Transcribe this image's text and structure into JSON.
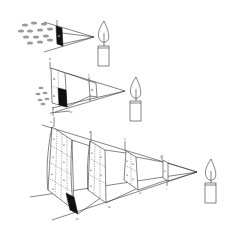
{
  "diagram": {
    "title": "",
    "panels": [
      {
        "id": "panel-1",
        "labels": {
          "area": "A",
          "distance": "1"
        },
        "has_moths": true
      },
      {
        "id": "panel-2",
        "labels": {
          "area": "A",
          "near_distance": "1",
          "far_distance": "2",
          "tick": "2r"
        },
        "has_moths": true
      },
      {
        "id": "panel-3",
        "labels": {
          "area": "A",
          "distances": [
            "1",
            "2",
            "3",
            "4"
          ],
          "ticks": [
            "r",
            "2r",
            "3r",
            "4r"
          ]
        },
        "has_moths": false
      }
    ],
    "colors": {
      "line": "#333333",
      "shaded": "#111111",
      "moth": "#9a9a9a"
    }
  }
}
